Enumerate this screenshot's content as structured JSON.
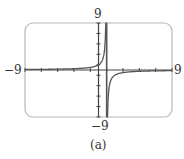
{
  "chart_data": {
    "type": "line",
    "title": "",
    "caption": "(a)",
    "xlabel": "",
    "ylabel": "",
    "xlim": [
      -9,
      9
    ],
    "ylim": [
      -9,
      9
    ],
    "x_tick_step": 2,
    "y_tick_step": 2,
    "grid": false,
    "legend": null,
    "axis_labels": {
      "xmin": "−9",
      "xmax": "9",
      "ymin": "−9",
      "ymax": "9"
    },
    "series": [
      {
        "name": "f(x)",
        "expression": "y = 1/(1 - x)",
        "vertical_asymptote": 1,
        "horizontal_asymptote": 0,
        "x": [
          -9,
          -7,
          -5,
          -3,
          -1,
          0,
          0.5,
          0.8,
          0.9,
          1.1,
          1.2,
          1.5,
          2,
          3,
          5,
          7,
          9
        ],
        "values": [
          0.1,
          0.125,
          0.167,
          0.25,
          0.5,
          1,
          2,
          5,
          10,
          -10,
          -5,
          -2,
          -1,
          -0.5,
          -0.25,
          -0.167,
          -0.125
        ]
      }
    ]
  },
  "colors": {
    "frame": "#b8b8b8",
    "axis": "#444444",
    "curve": "#555555",
    "text": "#333333"
  }
}
